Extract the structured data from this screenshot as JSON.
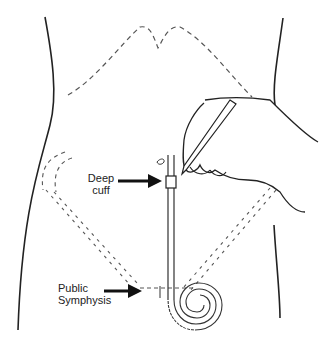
{
  "diagram": {
    "type": "anatomical illustration",
    "labels": {
      "deep_cuff_line1": "Deep",
      "deep_cuff_line2": "cuff",
      "pubic_line1": "Public",
      "pubic_line2": "Symphysis"
    },
    "colors": {
      "line": "#222222",
      "dash": "#555555",
      "background": "#ffffff"
    }
  }
}
